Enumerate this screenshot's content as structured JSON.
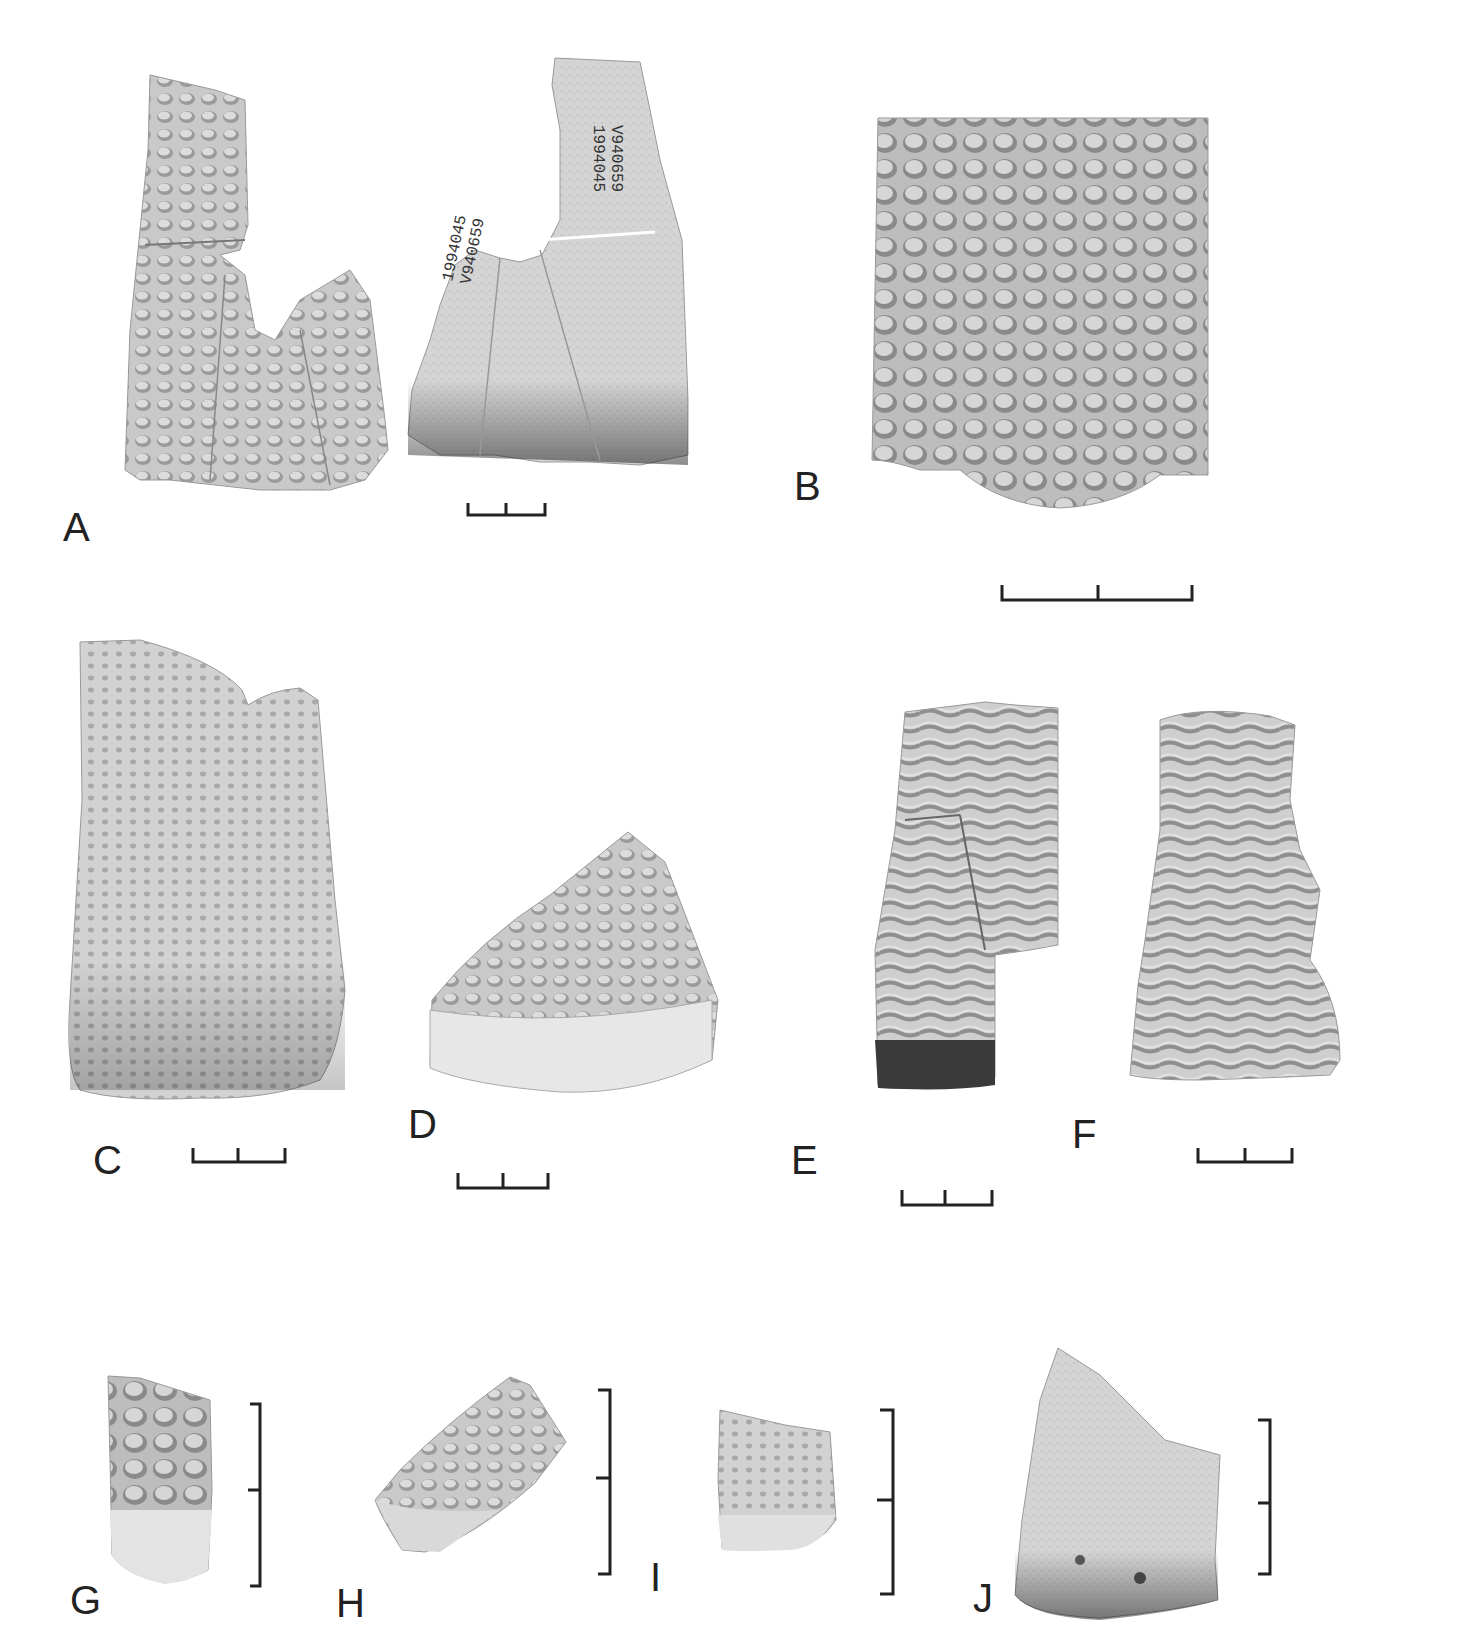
{
  "figure": {
    "panels": [
      {
        "id": "A",
        "label": "A",
        "description": "Two views of a dimple-textured vessel rim sherd (exterior and interior)",
        "catalogue_notes": [
          "V940659",
          "1994045"
        ]
      },
      {
        "id": "B",
        "label": "B",
        "description": "Close-up of honeycomb dimple texture"
      },
      {
        "id": "C",
        "label": "C",
        "description": "Sherd with shallow dimple texture"
      },
      {
        "id": "D",
        "label": "D",
        "description": "Triangular sherd with dimple texture"
      },
      {
        "id": "E",
        "label": "E",
        "description": "Rim sherd with horizontal ripple texture"
      },
      {
        "id": "F",
        "label": "F",
        "description": "Sherd with horizontal ripple texture"
      },
      {
        "id": "G",
        "label": "G",
        "description": "Small sherd with coarse dimples"
      },
      {
        "id": "H",
        "label": "H",
        "description": "Small sherd with dimple texture"
      },
      {
        "id": "I",
        "label": "I",
        "description": "Small sherd with fine dense dimples"
      },
      {
        "id": "J",
        "label": "J",
        "description": "Sherd with fine punctate texture"
      }
    ],
    "scale_bars": [
      "A",
      "B",
      "C",
      "D",
      "E",
      "F",
      "G",
      "H",
      "I",
      "J"
    ]
  }
}
